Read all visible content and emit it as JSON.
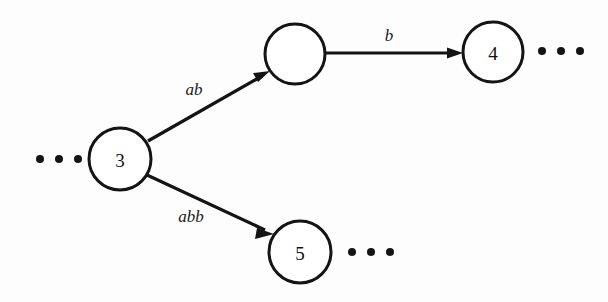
{
  "diagram": {
    "type": "state-transition-graph",
    "background_color": "#fdfdfd",
    "stroke_color": "#141414",
    "node_fill_color": "#ffffff",
    "nodes": [
      {
        "id": "n3",
        "label": "3",
        "cx": 120,
        "cy": 159,
        "r": 31
      },
      {
        "id": "n_unlabeled",
        "label": "",
        "cx": 295,
        "cy": 54,
        "r": 30
      },
      {
        "id": "n4",
        "label": "4",
        "cx": 493,
        "cy": 52,
        "r": 30
      },
      {
        "id": "n5",
        "label": "5",
        "cx": 300,
        "cy": 252,
        "r": 31
      }
    ],
    "edges": [
      {
        "id": "e_ab",
        "label": "ab",
        "from": "n3",
        "to": "n_unlabeled",
        "label_x": 194,
        "label_y": 89
      },
      {
        "id": "e_b",
        "label": "b",
        "from": "n_unlabeled",
        "to": "n4",
        "label_x": 389,
        "label_y": 35
      },
      {
        "id": "e_abb",
        "label": "abb",
        "from": "n3",
        "to": "n5",
        "label_x": 191,
        "label_y": 216
      }
    ],
    "ellipses": [
      {
        "id": "ellipsis-left-of-node3",
        "x": 40,
        "y": 159,
        "count": 3,
        "spacing": 19,
        "radius": 4
      },
      {
        "id": "ellipsis-right-of-node4",
        "x": 542,
        "y": 51,
        "count": 3,
        "spacing": 19,
        "radius": 4
      },
      {
        "id": "ellipsis-right-of-node5",
        "x": 352,
        "y": 252,
        "count": 3,
        "spacing": 19,
        "radius": 4
      }
    ]
  }
}
